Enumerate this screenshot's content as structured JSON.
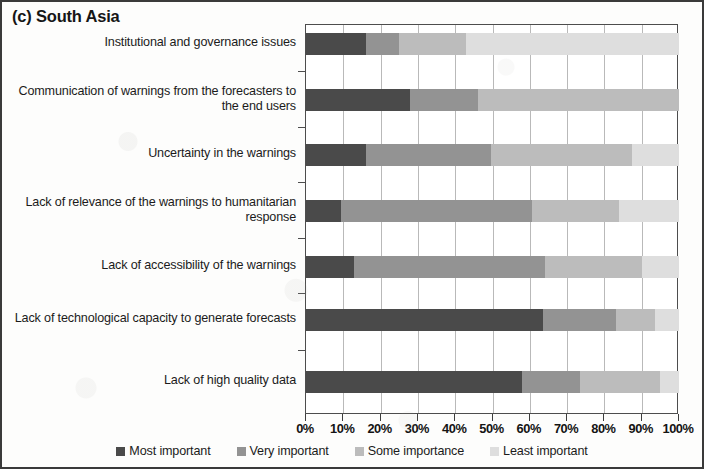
{
  "panel": {
    "title": "(c) South Asia"
  },
  "chart_data": {
    "type": "bar",
    "orientation": "horizontal",
    "stacked": true,
    "stacked_mode": "percent",
    "title": "(c) South Asia",
    "xlabel": "",
    "ylabel": "",
    "xlim": [
      0,
      100
    ],
    "xticks": [
      0,
      10,
      20,
      30,
      40,
      50,
      60,
      70,
      80,
      90,
      100
    ],
    "tick_labels": [
      "0%",
      "10%",
      "20%",
      "30%",
      "40%",
      "50%",
      "60%",
      "70%",
      "80%",
      "90%",
      "100%"
    ],
    "grid": "vertical",
    "legend_position": "bottom",
    "categories": [
      "Institutional and governance issues",
      "Communication of warnings from the forecasters to the end users",
      "Uncertainty in the warnings",
      "Lack of relevance of the warnings to humanitarian response",
      "Lack of accessibility of the warnings",
      "Lack of technological capacity to generate forecasts",
      "Lack of high quality data"
    ],
    "series": [
      {
        "name": "Most important",
        "color": "#4a4a4a",
        "values": [
          16,
          28,
          16,
          9.5,
          13,
          63.5,
          58
        ]
      },
      {
        "name": "Very important",
        "color": "#939393",
        "values": [
          9,
          18,
          33.5,
          51,
          51,
          19.5,
          15.5
        ]
      },
      {
        "name": "Some importance",
        "color": "#bcbcbc",
        "values": [
          18,
          54,
          38,
          23.5,
          26,
          10.5,
          21.5
        ]
      },
      {
        "name": "Least important",
        "color": "#dedede",
        "values": [
          57,
          0,
          12.5,
          16,
          10,
          6.5,
          5
        ]
      }
    ]
  },
  "legend": {
    "items": [
      {
        "label": "Most important",
        "color": "#4a4a4a"
      },
      {
        "label": "Very important",
        "color": "#939393"
      },
      {
        "label": "Some importance",
        "color": "#bcbcbc"
      },
      {
        "label": "Least important",
        "color": "#dedede"
      }
    ]
  }
}
